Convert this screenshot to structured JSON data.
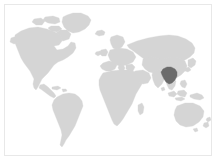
{
  "figure": {
    "type": "world-locator-map",
    "title": "",
    "caption": "",
    "width": 217,
    "height": 161
  },
  "map": {
    "projection": "equirectangular",
    "background_color": "#ffffff",
    "land_color": "#d5d5d5",
    "land_stroke_color": "#d5d5d5",
    "highlight_color": "#6b6b6b",
    "frame_color": "#e8e8e8",
    "frame_visible": true,
    "graticule_visible": false,
    "labels_visible": false,
    "legend_visible": false,
    "continents": [
      "North America",
      "South America",
      "Europe",
      "Africa",
      "Asia",
      "Australia",
      "Greenland",
      "New Zealand",
      "Japan",
      "Madagascar",
      "British Isles",
      "Indonesia",
      "Philippines"
    ],
    "highlight": {
      "name": "Southern China",
      "region_label": "",
      "color": "#6b6b6b",
      "center_x_px": 164,
      "center_y_px": 75,
      "approx_lon": 110,
      "approx_lat": 24
    }
  }
}
